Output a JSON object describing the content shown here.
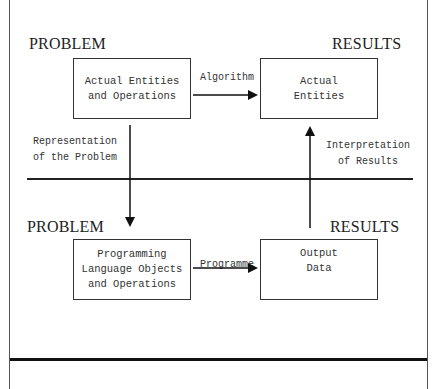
{
  "diagram": {
    "top_left_heading": "PROBLEM",
    "top_right_heading": "RESULTS",
    "bottom_left_heading": "PROBLEM",
    "bottom_right_heading": "RESULTS",
    "boxes": {
      "actual_ops": [
        "Actual Entities",
        "and Operations"
      ],
      "actual_entities": [
        "Actual",
        "Entities"
      ],
      "programming": [
        "Programming",
        "Language Objects",
        "and Operations"
      ],
      "output": [
        "Output",
        "Data"
      ]
    },
    "arrows": {
      "algorithm": "Algorithm",
      "programme": "Programme",
      "representation": [
        "Representation",
        "of the Problem"
      ],
      "interpretation": [
        "Interpretation",
        "of Results"
      ]
    }
  }
}
